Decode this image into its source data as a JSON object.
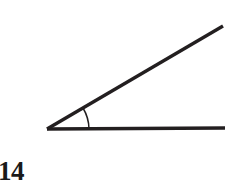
{
  "figure": {
    "kind": "angle-diagram",
    "caption_number": "14",
    "background_color": "#ffffff",
    "stroke_color": "#231f20",
    "arc_color": "#231f20",
    "canvas": {
      "width": 249,
      "height": 180
    },
    "vertex": {
      "x": 47,
      "y": 129
    },
    "rays": [
      {
        "name": "horizontal-ray",
        "from": {
          "x": 47,
          "y": 129
        },
        "to": {
          "x": 225,
          "y": 128
        },
        "stroke_width": 3.4
      },
      {
        "name": "diagonal-ray",
        "from": {
          "x": 47,
          "y": 129
        },
        "to": {
          "x": 223,
          "y": 26
        },
        "stroke_width": 3.4
      }
    ],
    "angle": {
      "measure_degrees": 30,
      "arc_radius": 42,
      "arc_start": {
        "x": 83,
        "y": 108
      },
      "arc_end": {
        "x": 89,
        "y": 129
      },
      "stroke_width": 1.5
    }
  }
}
